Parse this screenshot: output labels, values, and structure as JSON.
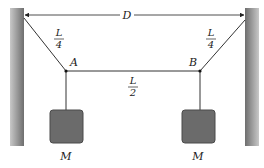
{
  "diagram": {
    "labels": {
      "distance": "D",
      "left_segment_num": "L",
      "left_segment_den": "4",
      "right_segment_num": "L",
      "right_segment_den": "4",
      "middle_segment_num": "L",
      "middle_segment_den": "2",
      "point_a": "A",
      "point_b": "B",
      "mass_left": "M",
      "mass_right": "M"
    },
    "colors": {
      "wall": "#7a7a7a",
      "mass": "#6b6b6b",
      "string": "#333333"
    }
  }
}
